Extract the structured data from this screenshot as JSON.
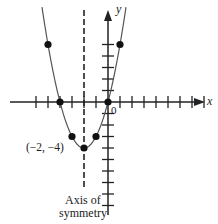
{
  "chart_data": {
    "type": "line",
    "title": "",
    "function": "y = x^2 + 4x",
    "x_axis_label": "x",
    "y_axis_label": "y",
    "origin_label": "0",
    "points": [
      {
        "x": -5,
        "y": 5
      },
      {
        "x": -4,
        "y": 0
      },
      {
        "x": -3,
        "y": -3
      },
      {
        "x": -2,
        "y": -4
      },
      {
        "x": -1,
        "y": -3
      },
      {
        "x": 0,
        "y": 0
      },
      {
        "x": 1,
        "y": 5
      }
    ],
    "vertex": {
      "x": -2,
      "y": -4,
      "label": "(−2, −4)"
    },
    "axis_of_symmetry": {
      "x": -2,
      "style": "dashed"
    },
    "xlim": [
      -8,
      8
    ],
    "ylim": [
      -6,
      7
    ]
  },
  "labels": {
    "x_axis": "x",
    "y_axis": "y",
    "origin": "0",
    "vertex": "(−2, −4)",
    "symmetry_line1": "Axis of",
    "symmetry_line2": "symmetry"
  }
}
